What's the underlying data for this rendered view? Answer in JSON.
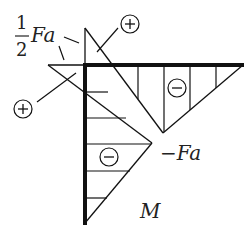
{
  "diagram": {
    "title": "M",
    "labels": {
      "half_numerator": "1",
      "half_denominator": "2",
      "half_Fa": "Fa",
      "neg_Fa": "−Fa",
      "diagram_name": "M"
    },
    "signs": {
      "top_plus": "+",
      "left_plus": "+",
      "right_minus": "−",
      "lower_minus": "−"
    },
    "colors": {
      "line": "#111111",
      "background": "#ffffff"
    }
  }
}
